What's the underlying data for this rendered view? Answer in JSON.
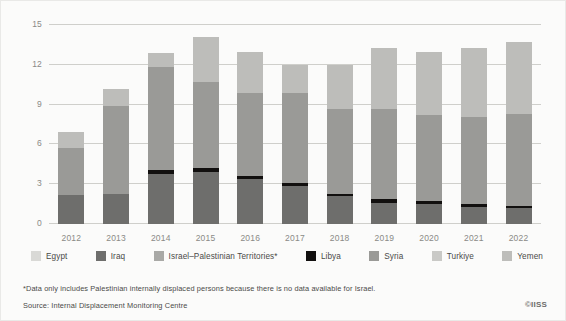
{
  "chart_data": {
    "type": "bar",
    "subtype": "stacked-bar",
    "title": "",
    "xlabel": "",
    "ylabel": "",
    "ylim": [
      0,
      15
    ],
    "yticks": [
      0,
      3,
      6,
      9,
      12,
      15
    ],
    "grid": true,
    "legend_position": "bottom",
    "categories": [
      "2012",
      "2013",
      "2014",
      "2015",
      "2016",
      "2017",
      "2018",
      "2019",
      "2020",
      "2021",
      "2022"
    ],
    "series": [
      {
        "name": "Iraq",
        "color": "#6e6e6c",
        "values": [
          2.2,
          2.3,
          3.8,
          3.9,
          3.4,
          2.9,
          2.1,
          1.6,
          1.5,
          1.3,
          1.2
        ]
      },
      {
        "name": "Libya",
        "color": "#12100f",
        "values": [
          0.0,
          0.0,
          0.3,
          0.3,
          0.2,
          0.2,
          0.2,
          0.3,
          0.2,
          0.2,
          0.15
        ]
      },
      {
        "name": "Syria",
        "color": "#9a9a97",
        "values": [
          3.55,
          6.6,
          7.7,
          6.5,
          6.3,
          6.8,
          6.4,
          6.8,
          6.5,
          6.6,
          6.95
        ]
      },
      {
        "name": "Israel-Palestinian Territories*",
        "color": "#a9a9a6",
        "values": [
          0.0,
          0.0,
          0.0,
          0.0,
          0.0,
          0.0,
          0.0,
          0.0,
          0.0,
          0.0,
          0.0
        ]
      },
      {
        "name": "Turkiye",
        "color": "#c9c9c6",
        "values": [
          0.0,
          0.0,
          0.0,
          0.0,
          0.0,
          0.0,
          0.0,
          0.0,
          0.0,
          0.0,
          0.0
        ]
      },
      {
        "name": "Egypt",
        "color": "#d9d9d6",
        "values": [
          0.0,
          0.0,
          0.0,
          0.0,
          0.0,
          0.0,
          0.0,
          0.0,
          0.0,
          0.0,
          0.0
        ]
      },
      {
        "name": "Yemen",
        "color": "#bdbdba",
        "values": [
          1.15,
          1.3,
          1.1,
          3.4,
          3.1,
          2.1,
          3.3,
          4.6,
          4.8,
          5.2,
          5.4
        ]
      }
    ],
    "totals": [
      6.9,
      10.2,
      12.9,
      14.1,
      13.0,
      12.0,
      12.0,
      13.3,
      13.0,
      13.3,
      13.7
    ],
    "stack_order": [
      "Iraq",
      "Libya",
      "Syria",
      "Yemen"
    ]
  },
  "legend": {
    "items": [
      {
        "label": "Egypt",
        "color": "#d9d9d6"
      },
      {
        "label": "Iraq",
        "color": "#6e6e6c"
      },
      {
        "label": "Israel–Palestinian Territories*",
        "color": "#a9a9a6"
      },
      {
        "label": "Libya",
        "color": "#12100f"
      },
      {
        "label": "Syria",
        "color": "#9a9a97"
      },
      {
        "label": "Turkiye",
        "color": "#c9c9c6"
      },
      {
        "label": "Yemen",
        "color": "#bdbdba"
      }
    ]
  },
  "notes": {
    "footnote": "*Data only includes Palestinian internally displaced persons because there is no data available for Israel.",
    "source": "Source: Internal Displacement Monitoring Centre",
    "logo": "©IISS"
  }
}
